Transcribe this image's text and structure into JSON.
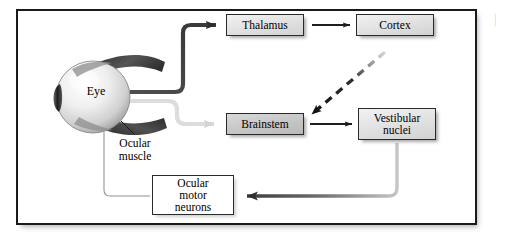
{
  "figure": {
    "type": "flow-diagram",
    "background_color": "#ffffff",
    "frame_border_color": "#1a1a1a"
  },
  "nodes": [
    {
      "id": "thalamus",
      "label": "Thalamus",
      "fill": "#e3e3e3",
      "style": "shaded"
    },
    {
      "id": "cortex",
      "label": "Cortex",
      "fill": "#e3e3e3",
      "style": "shaded"
    },
    {
      "id": "brainstem",
      "label": "Brainstem",
      "fill": "#c9c9c9",
      "style": "darker"
    },
    {
      "id": "vestibular",
      "label": "Vestibular\nnuclei",
      "fill": "#e3e3e3",
      "style": "shaded"
    },
    {
      "id": "ocular_motor_neurons",
      "label": "Ocular\nmotor\nneurons",
      "fill": "#ffffff",
      "style": "plain"
    }
  ],
  "annotations": {
    "eye_label": "Eye",
    "ocular_muscle_label": "Ocular\nmuscle",
    "edge_mark": "|"
  },
  "edges": [
    {
      "id": "eye-to-thalamus",
      "from": "eye",
      "to": "thalamus",
      "style": "solid-thick-dark",
      "color": "#3a3a3a"
    },
    {
      "id": "thalamus-to-cortex",
      "from": "thalamus",
      "to": "cortex",
      "style": "solid-thin-dark",
      "color": "#1f1f1f"
    },
    {
      "id": "eye-to-brainstem",
      "from": "eye",
      "to": "brainstem",
      "style": "solid-thick-light",
      "color": "#dcdcdc"
    },
    {
      "id": "cortex-to-brainstem",
      "from": "cortex",
      "to": "brainstem",
      "style": "dashed-gradient",
      "color": "#222222"
    },
    {
      "id": "brainstem-to-vestibular",
      "from": "brainstem",
      "to": "vestibular",
      "style": "solid-thin-dark",
      "color": "#1f1f1f"
    },
    {
      "id": "vestibular-to-ocularmn",
      "from": "vestibular",
      "to": "ocular_motor_neurons",
      "style": "solid-thick-gradient",
      "color": "#4a4a4a"
    },
    {
      "id": "ocularmn-to-eye",
      "from": "ocular_motor_neurons",
      "to": "eye",
      "style": "solid-hairline",
      "color": "#8a8a8a"
    }
  ],
  "eye": {
    "globe_color_light": "#f4f4f4",
    "globe_color_dark": "#9a9a9a",
    "pupil_color": "#2b2b2b",
    "muscle_color": "#3a3a3a"
  }
}
